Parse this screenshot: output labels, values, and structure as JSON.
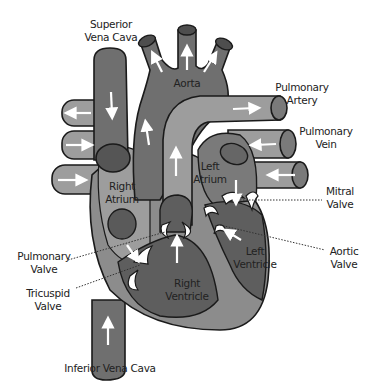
{
  "diagram": {
    "colors": {
      "dark": "#5a5a5a",
      "medium": "#7a7a7a",
      "light": "#9d9d9d",
      "outline": "#1a1a1a",
      "arrow": "#ffffff",
      "text": "#222222"
    },
    "labels": {
      "superior_vena_cava_1": "Superior",
      "superior_vena_cava_2": "Vena Cava",
      "aorta": "Aorta",
      "pulmonary_artery_1": "Pulmonary",
      "pulmonary_artery_2": "Artery",
      "pulmonary_vein_1": "Pulmonary",
      "pulmonary_vein_2": "Vein",
      "left_atrium_1": "Left",
      "left_atrium_2": "Atrium",
      "right_atrium_1": "Right",
      "right_atrium_2": "Atrium",
      "mitral_valve_1": "Mitral",
      "mitral_valve_2": "Valve",
      "aortic_valve_1": "Aortic",
      "aortic_valve_2": "Valve",
      "left_ventricle_1": "Left",
      "left_ventricle_2": "Ventricle",
      "right_ventricle_1": "Right",
      "right_ventricle_2": "Ventricle",
      "pulmonary_valve_1": "Pulmonary",
      "pulmonary_valve_2": "Valve",
      "tricuspid_valve_1": "Tricuspid",
      "tricuspid_valve_2": "Valve",
      "inferior_vena_cava": "Inferior Vena Cava"
    }
  }
}
